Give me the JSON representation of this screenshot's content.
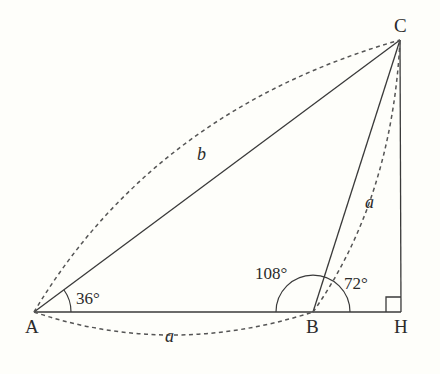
{
  "diagram": {
    "type": "geometry-triangle",
    "points": {
      "A": {
        "label": "A",
        "x": 34,
        "y": 312
      },
      "B": {
        "label": "B",
        "x": 313,
        "y": 312
      },
      "H": {
        "label": "H",
        "x": 401,
        "y": 312
      },
      "C": {
        "label": "C",
        "x": 400,
        "y": 40
      }
    },
    "angles": {
      "A": "36°",
      "B_exterior": "108°",
      "B_interior": "72°"
    },
    "lengths": {
      "AC": "b",
      "AB": "a",
      "BC": "a"
    },
    "right_angle_at": "H",
    "colors": {
      "background": "#fefefa",
      "stroke": "#3a3a3a"
    }
  }
}
